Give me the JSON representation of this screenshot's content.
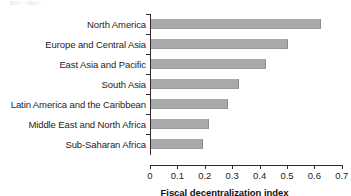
{
  "chart_data": {
    "type": "bar",
    "orientation": "horizontal",
    "title": "",
    "xlabel": "Fiscal decentralization index",
    "ylabel": "",
    "xlim": [
      0,
      0.7
    ],
    "xticks": [
      "0",
      "0.1",
      "0.2",
      "0.3",
      "0.4",
      "0.5",
      "0.6",
      "0.7"
    ],
    "xtick_values": [
      0,
      0.1,
      0.2,
      0.3,
      0.4,
      0.5,
      0.6,
      0.7
    ],
    "grid": false,
    "legend": null,
    "bar_color": "#a9a9a9",
    "axis_color": "#2b2b2b",
    "categories": [
      "North America",
      "Europe and Central Asia",
      "East Asia and Pacific",
      "South Asia",
      "Latin America and the Caribbean",
      "Middle East and North Africa",
      "Sub-Saharan Africa"
    ],
    "values": [
      0.62,
      0.5,
      0.42,
      0.32,
      0.28,
      0.21,
      0.19
    ]
  }
}
